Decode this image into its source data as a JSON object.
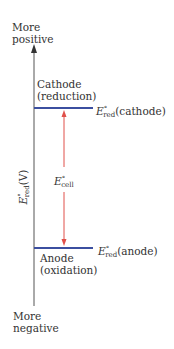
{
  "diagram": {
    "top_label_line1": "More",
    "top_label_line2": "positive",
    "bottom_label_line1": "More",
    "bottom_label_line2": "negative",
    "y_axis_label_E": "E",
    "y_axis_label_sup": "°",
    "y_axis_label_sub": "red",
    "y_axis_label_unit": "(V)",
    "cathode_label_line1": "Cathode",
    "cathode_label_line2": "(reduction)",
    "cathode_potential_E": "E",
    "cathode_potential_sup": "°",
    "cathode_potential_sub": "red",
    "cathode_potential_suffix": "(cathode)",
    "anode_label_line1": "Anode",
    "anode_label_line2": "(oxidation)",
    "anode_potential_E": "E",
    "anode_potential_sup": "°",
    "anode_potential_sub": "red",
    "anode_potential_suffix": "(anode)",
    "cell_potential_E": "E",
    "cell_potential_sup": "°",
    "cell_potential_sub": "cell",
    "colors": {
      "axis": "#555555",
      "level_lines": "#3b4fa0",
      "cell_arrow": "#e0504a",
      "text": "#333333"
    }
  }
}
